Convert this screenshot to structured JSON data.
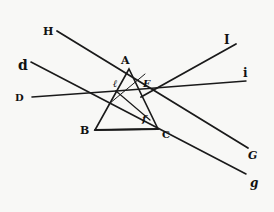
{
  "figure": {
    "prism": {
      "vertices": {
        "A": {
          "label": "A",
          "x": 129,
          "y": 69
        },
        "B": {
          "label": "B",
          "x": 95,
          "y": 130
        },
        "C": {
          "label": "C",
          "x": 158,
          "y": 129
        }
      }
    },
    "labels": {
      "H": "H",
      "d": "d",
      "D": "D",
      "A": "A",
      "B": "B",
      "C": "C",
      "e": "ℓ",
      "F": "F",
      "f": "f",
      "I": "I",
      "i": "i",
      "G": "G",
      "g": "g"
    },
    "rays": [
      {
        "name": "ray-H-to-G",
        "from": "H",
        "to": "G",
        "x1": 57,
        "y1": 31,
        "x2": 248,
        "y2": 148
      },
      {
        "name": "ray-d-to-g",
        "from": "d",
        "to": "g",
        "x1": 31,
        "y1": 62,
        "x2": 246,
        "y2": 174
      },
      {
        "name": "ray-D-to-e",
        "from": "D",
        "to": "e",
        "x1": 32,
        "y1": 97,
        "x2": 116,
        "y2": 91
      },
      {
        "name": "ray-e-to-i",
        "from": "e",
        "to": "i",
        "x1": 116,
        "y1": 91,
        "x2": 246,
        "y2": 81
      },
      {
        "name": "ray-f-to-I",
        "from": "f",
        "to": "I",
        "x1": 140,
        "y1": 98,
        "x2": 236,
        "y2": 44
      }
    ],
    "colors": {
      "ink": "#1a1a1a",
      "paper": "#f8f8f6"
    }
  }
}
